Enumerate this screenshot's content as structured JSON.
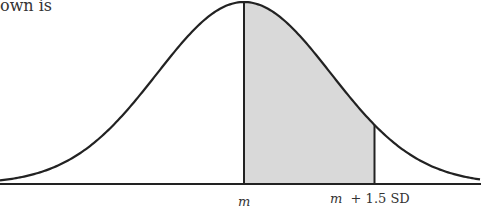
{
  "intro_text": "own is",
  "diagram": {
    "type": "normal-distribution-curve",
    "shaded_region": {
      "from": "m",
      "to": "m + 1.5 SD",
      "fill": "#d9d9d9"
    },
    "labels": {
      "mean": "m",
      "upper_m": "m",
      "upper_rest": "+ 1.5 SD"
    },
    "shade_sd_end": 1.5,
    "line_color": "#222222"
  }
}
